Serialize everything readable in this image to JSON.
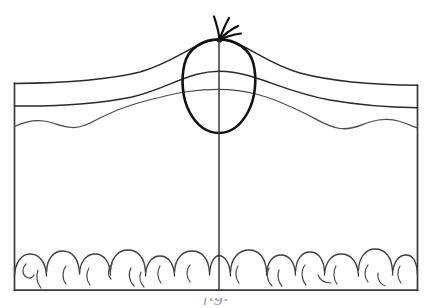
{
  "figure": {
    "medium": "hand-drawn pen-and-ink line drawing",
    "background_color": "#ffffff",
    "ink_color": "#2a2a2a",
    "lesion_ink_color": "#111111",
    "canvas": {
      "width": 432,
      "height": 308
    }
  },
  "frame": {
    "name": "specimen-block-outline",
    "left": 14,
    "top": 82,
    "right": 418,
    "bottom": 290,
    "stroke": "#3a3a3a",
    "stroke_width": 1.7
  },
  "lesion": {
    "name": "ovoid-lesion",
    "shape": "egg / ovoid",
    "center_x": 219,
    "center_y": 86,
    "radius_x": 35,
    "radius_y": 47,
    "top_y": 39,
    "bottom_y": 133,
    "left_x": 184,
    "right_x": 254,
    "stroke": "#111111",
    "stroke_width": 2.6
  },
  "hair_tuft": {
    "name": "hair-tuft",
    "origin_x": 219,
    "origin_y": 40,
    "strand_count": 4,
    "stroke": "#0d0d0d",
    "stroke_width": 2.2
  },
  "midline": {
    "name": "vertical-midline",
    "x": 219,
    "top_y": 40,
    "bottom_y": 290,
    "stroke": "#383838",
    "stroke_width": 1.5
  },
  "tissue_planes": [
    {
      "name": "plane-upper-surface",
      "label": "upper surface plane",
      "left_y": 84,
      "right_y": 85,
      "peak_y": 40,
      "style": "smooth arch rising to lesion apex",
      "stroke_width": 1.5
    },
    {
      "name": "plane-middle",
      "label": "middle tissue plane",
      "left_y": 106,
      "right_y": 108,
      "peak_y": 72,
      "style": "smooth arch crossing lesion",
      "stroke_width": 1.5
    },
    {
      "name": "plane-lower-wavy",
      "label": "lower wavy tissue plane",
      "left_y": 126,
      "right_y": 128,
      "peak_y": 90,
      "style": "undulating / wavy, crossing lesion",
      "stroke_width": 1.25
    }
  ],
  "fat_layer": {
    "name": "subcutaneous-fat-layer",
    "label": "scalloped lobule band",
    "band_top_y": 252,
    "band_bottom_y": 290,
    "lobule_count": 16,
    "stroke": "#3d3d3d",
    "stroke_width": 1.35
  },
  "caption": {
    "name": "figure-caption",
    "text": "fig.",
    "state": "cropped at bottom edge of image, only top sliver of letters visible",
    "top_y": 298,
    "visible_height": 10,
    "color": "#555555"
  }
}
